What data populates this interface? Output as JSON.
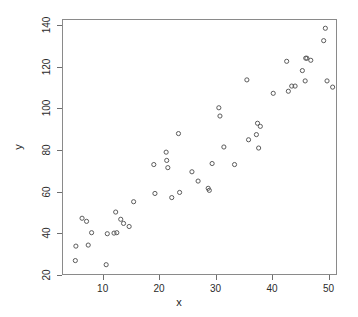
{
  "chart_data": {
    "type": "scatter",
    "title": "",
    "subtitle": "",
    "xlabel": "x",
    "ylabel": "y",
    "xlim": [
      2.8,
      51.5
    ],
    "ylim": [
      20,
      143
    ],
    "grid": false,
    "legend": null,
    "marker": {
      "shape": "circle",
      "filled": false,
      "color": "#5a5a5a",
      "radius_px": 2.1
    },
    "xticks": [
      10,
      20,
      30,
      40,
      50
    ],
    "yticks": [
      20,
      40,
      60,
      80,
      100,
      120,
      140
    ],
    "xtick_labels": [
      "10",
      "20",
      "30",
      "40",
      "50"
    ],
    "ytick_labels": [
      "20",
      "40",
      "60",
      "80",
      "100",
      "120",
      "140"
    ],
    "n_points": 52,
    "points": [
      {
        "x": 5.0,
        "y": 26.5
      },
      {
        "x": 5.1,
        "y": 33.5
      },
      {
        "x": 6.2,
        "y": 47.0
      },
      {
        "x": 7.0,
        "y": 45.5
      },
      {
        "x": 7.3,
        "y": 34.0
      },
      {
        "x": 7.9,
        "y": 40.0
      },
      {
        "x": 10.5,
        "y": 24.5
      },
      {
        "x": 10.7,
        "y": 39.5
      },
      {
        "x": 11.9,
        "y": 39.8
      },
      {
        "x": 12.2,
        "y": 50.0
      },
      {
        "x": 12.4,
        "y": 40.0
      },
      {
        "x": 13.1,
        "y": 46.5
      },
      {
        "x": 13.6,
        "y": 44.5
      },
      {
        "x": 14.6,
        "y": 43.0
      },
      {
        "x": 15.4,
        "y": 55.0
      },
      {
        "x": 19.0,
        "y": 73.0
      },
      {
        "x": 19.2,
        "y": 59.0
      },
      {
        "x": 21.2,
        "y": 79.0
      },
      {
        "x": 21.3,
        "y": 75.0
      },
      {
        "x": 21.5,
        "y": 71.5
      },
      {
        "x": 22.2,
        "y": 57.0
      },
      {
        "x": 23.4,
        "y": 88.0
      },
      {
        "x": 23.6,
        "y": 59.5
      },
      {
        "x": 25.8,
        "y": 69.5
      },
      {
        "x": 26.9,
        "y": 65.0
      },
      {
        "x": 28.7,
        "y": 61.5
      },
      {
        "x": 28.9,
        "y": 60.5
      },
      {
        "x": 29.4,
        "y": 73.5
      },
      {
        "x": 30.6,
        "y": 100.5
      },
      {
        "x": 30.8,
        "y": 96.5
      },
      {
        "x": 31.5,
        "y": 81.5
      },
      {
        "x": 33.4,
        "y": 73.0
      },
      {
        "x": 35.6,
        "y": 114.0
      },
      {
        "x": 35.9,
        "y": 85.0
      },
      {
        "x": 37.3,
        "y": 87.5
      },
      {
        "x": 37.5,
        "y": 93.0
      },
      {
        "x": 37.7,
        "y": 81.0
      },
      {
        "x": 38.0,
        "y": 91.5
      },
      {
        "x": 40.3,
        "y": 107.5
      },
      {
        "x": 42.7,
        "y": 123.0
      },
      {
        "x": 43.0,
        "y": 108.5
      },
      {
        "x": 43.6,
        "y": 111.0
      },
      {
        "x": 44.2,
        "y": 111.0
      },
      {
        "x": 45.5,
        "y": 118.5
      },
      {
        "x": 46.1,
        "y": 124.5
      },
      {
        "x": 46.3,
        "y": 124.5
      },
      {
        "x": 46.0,
        "y": 113.5
      },
      {
        "x": 47.0,
        "y": 123.5
      },
      {
        "x": 49.3,
        "y": 133.0
      },
      {
        "x": 49.6,
        "y": 139.0
      },
      {
        "x": 49.9,
        "y": 113.5
      },
      {
        "x": 50.9,
        "y": 110.5
      }
    ]
  },
  "axes": {
    "xlabel": "x",
    "ylabel": "y"
  }
}
